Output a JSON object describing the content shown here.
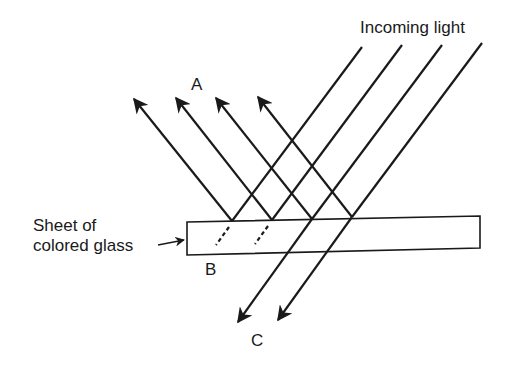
{
  "diagram": {
    "labels": {
      "incoming": "Incoming light",
      "reflected": "A",
      "absorbed": "B",
      "transmitted": "C",
      "glass_line1": "Sheet of",
      "glass_line2": "colored glass"
    },
    "colors": {
      "stroke": "#1a1a1a",
      "background": "#ffffff"
    },
    "rays": {
      "incoming_count": 4,
      "reflected_count": 4,
      "absorbed_count": 2,
      "transmitted_count": 2
    }
  }
}
